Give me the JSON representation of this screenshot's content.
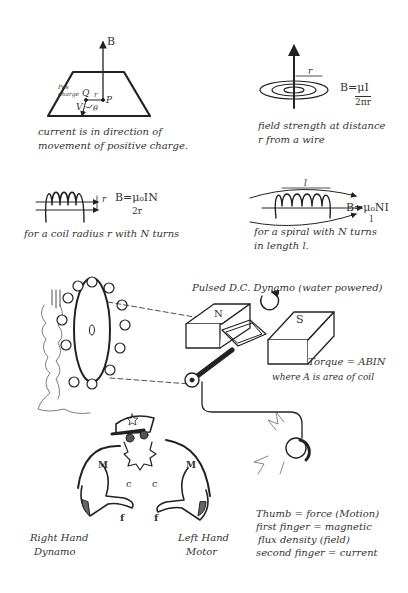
{
  "panels": {
    "moving_charge": {
      "field_label": "B",
      "charge_label": "Pos charge",
      "point_q": "Q",
      "point_p": "P",
      "r_label": "r",
      "v_label": "V",
      "theta_label": "θ",
      "caption_line1": "current is in direction of",
      "caption_line2": "movement of positive charge."
    },
    "wire": {
      "r_label": "r",
      "formula_top": "B=μI",
      "formula_bottom": "2πr",
      "caption_line1": "field strength at distance",
      "caption_line2": "r from a wire"
    },
    "coil": {
      "r_label": "r",
      "formula_top": "B=μ₀IN",
      "formula_bottom": "2r",
      "caption": "for a coil radius r with N turns"
    },
    "spiral": {
      "l_label": "l",
      "formula": "B=μ₀NI",
      "formula_sub": "l",
      "caption_line1": "for a spiral with N turns",
      "caption_line2": "in length l."
    },
    "dynamo": {
      "title": "Pulsed D.C. Dynamo (water powered)",
      "magnet_n": "N",
      "magnet_s": "S",
      "torque": "Torque = ABIN",
      "torque_note": "where A is area of coil"
    },
    "hands": {
      "right_line1": "Right Hand",
      "right_line2": "Dynamo",
      "left_line1": "Left Hand",
      "left_line2": "Motor",
      "finger_m": "M",
      "finger_c": "c",
      "finger_f": "f",
      "legend": [
        "Thumb = force (Motion)",
        "first finger = magnetic",
        "flux density (field)",
        "second finger = current"
      ]
    }
  }
}
